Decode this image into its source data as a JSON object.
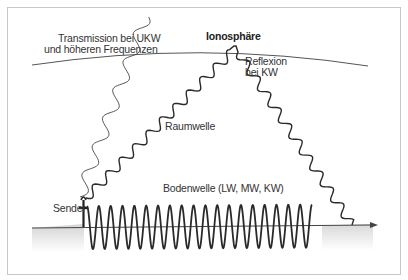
{
  "diagram": {
    "labels": {
      "transmission_line1": "Transmission bei UKW",
      "transmission_line2": "und höheren Frequenzen",
      "ionosphere": "Ionosphäre",
      "reflection_line1": "Reflexion",
      "reflection_line2": "bei KW",
      "sky_wave": "Raumwelle",
      "ground_wave": "Bodenwelle (LW, MW, KW)",
      "sender": "Sender"
    },
    "colors": {
      "line": "#333333",
      "ionosphere_line": "#555555",
      "frame": "#c8c8c8",
      "ground_shade": "#dcdcdc",
      "background": "#ffffff"
    },
    "elements": [
      {
        "id": "ionosphere",
        "type": "curve",
        "description": "Ionosphere boundary arc"
      },
      {
        "id": "earth-surface",
        "type": "arrow-line",
        "description": "Earth surface with arrow to the right"
      },
      {
        "id": "sender",
        "type": "antenna",
        "description": "Transmitter on the left"
      },
      {
        "id": "ground-wave",
        "type": "sine-wave",
        "description": "Ground wave along the surface"
      },
      {
        "id": "sky-wave",
        "type": "wavy-path",
        "description": "Sky wave reflected at the ionosphere"
      },
      {
        "id": "transmission-wave",
        "type": "wavy-path",
        "description": "Thin wave passing through the ionosphere (UKW)"
      }
    ]
  }
}
